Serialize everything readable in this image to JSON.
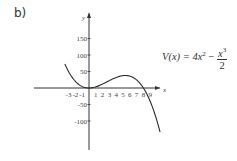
{
  "panel_label": "b)",
  "formula": {
    "lhs": "V(x) = 4x",
    "exp": "2",
    "minus": " − ",
    "num_base": "x",
    "num_exp": "3",
    "den": "2"
  },
  "chart_data": {
    "type": "line",
    "title": "",
    "xlabel": "x",
    "ylabel": "y",
    "function": "V(x) = 4x^2 - x^3/2",
    "x_ticks": [
      -3,
      -2,
      -1,
      1,
      2,
      3,
      4,
      5,
      6,
      7,
      8,
      9
    ],
    "y_ticks": [
      150,
      100,
      50,
      -50,
      -100
    ],
    "xlim": [
      -4,
      10
    ],
    "ylim": [
      -130,
      175
    ],
    "grid": false,
    "series": [
      {
        "name": "V(x)",
        "x": [
          -4,
          -3,
          -2,
          -1,
          0,
          1,
          2,
          3,
          4,
          5,
          5.33,
          6,
          7,
          8,
          9,
          10
        ],
        "values": [
          96,
          49.5,
          20,
          4.5,
          0,
          3.5,
          12,
          22.5,
          32,
          37.5,
          37.9,
          36,
          24.5,
          0,
          -40.5,
          -100
        ]
      }
    ],
    "annotations": [
      "V(x) = 4x^2 - x^3/2"
    ]
  },
  "colors": {
    "curve": "#2a2a2a",
    "axis": "#333333",
    "text": "#444444"
  }
}
